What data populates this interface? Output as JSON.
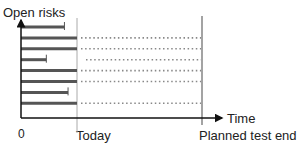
{
  "diagram": {
    "y_axis_label": "Open risks",
    "x_axis_label": "Time",
    "origin_label": "0",
    "markers": [
      {
        "id": "today",
        "label": "Today",
        "t": 0.32
      },
      {
        "id": "planned-test-end",
        "label": "Planned test end",
        "t": 1.0
      }
    ],
    "risks": [
      {
        "closed_at": 0.24,
        "status": "closed"
      },
      {
        "closed_at": null,
        "status": "open"
      },
      {
        "closed_at": null,
        "status": "open"
      },
      {
        "closed_at": 0.14,
        "status": "closed-dotted"
      },
      {
        "closed_at": null,
        "status": "open"
      },
      {
        "closed_at": null,
        "status": "open"
      },
      {
        "closed_at": 0.26,
        "status": "closed"
      },
      {
        "closed_at": null,
        "status": "open"
      }
    ],
    "colors": {
      "bar": "#555555",
      "axis": "#111111",
      "today_line": "#aaaaaa",
      "end_line": "#666666",
      "dots": "#888888"
    }
  }
}
